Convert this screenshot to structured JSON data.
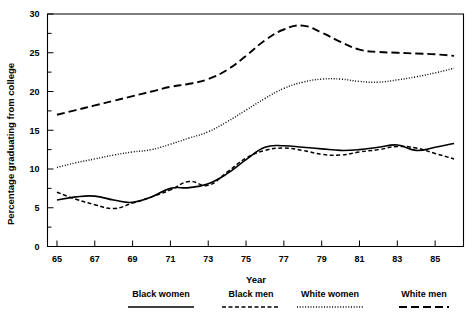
{
  "chart_data": {
    "type": "line",
    "title": "",
    "xlabel": "Year",
    "ylabel": "Percentage graduating from college",
    "xlim": [
      64.5,
      86.5
    ],
    "ylim": [
      0,
      30
    ],
    "xticks": [
      65,
      67,
      69,
      71,
      73,
      75,
      77,
      79,
      81,
      83,
      85
    ],
    "xtick_labels": [
      "65",
      "67",
      "69",
      "71",
      "73",
      "75",
      "77",
      "79",
      "81",
      "83",
      "85"
    ],
    "yticks": [
      0,
      5,
      10,
      15,
      20,
      25,
      30
    ],
    "ytick_labels": [
      "0",
      "5",
      "10",
      "15",
      "20",
      "25",
      "30"
    ],
    "y_minor_ticks": [
      2.5,
      7.5,
      12.5,
      17.5,
      22.5,
      27.5
    ],
    "grid": false,
    "legend_position": "below",
    "x": [
      65,
      66,
      67,
      68,
      69,
      70,
      71,
      72,
      73,
      74,
      75,
      76,
      77,
      78,
      79,
      80,
      81,
      82,
      83,
      84,
      85,
      86
    ],
    "series": [
      {
        "name": "Black women",
        "style": "solid",
        "values": [
          6.0,
          6.4,
          6.5,
          6.0,
          5.7,
          6.4,
          7.5,
          7.6,
          8.1,
          9.4,
          11.2,
          12.8,
          13.0,
          12.8,
          12.6,
          12.4,
          12.5,
          12.8,
          13.1,
          12.4,
          12.8,
          13.3
        ]
      },
      {
        "name": "Black men",
        "style": "dashed-short",
        "values": [
          7.0,
          6.1,
          5.4,
          4.9,
          5.6,
          6.4,
          7.3,
          8.4,
          7.9,
          9.6,
          11.4,
          12.4,
          12.7,
          12.4,
          11.9,
          11.8,
          12.2,
          12.5,
          12.9,
          12.7,
          12.0,
          11.3
        ]
      },
      {
        "name": "White women",
        "style": "dotted",
        "values": [
          10.2,
          10.8,
          11.3,
          11.8,
          12.2,
          12.5,
          13.2,
          14.0,
          14.8,
          16.1,
          17.6,
          19.1,
          20.4,
          21.2,
          21.6,
          21.6,
          21.3,
          21.2,
          21.5,
          21.9,
          22.4,
          23.0
        ]
      },
      {
        "name": "White men",
        "style": "dashed-long",
        "values": [
          17.0,
          17.6,
          18.2,
          18.8,
          19.4,
          20.0,
          20.6,
          21.0,
          21.6,
          22.8,
          24.6,
          26.6,
          28.0,
          28.5,
          27.6,
          26.4,
          25.4,
          25.1,
          25.0,
          24.9,
          24.8,
          24.6
        ]
      }
    ]
  },
  "axes": {
    "y_title": "Percentage graduating from college",
    "x_title": "Year"
  },
  "legend": {
    "items": [
      {
        "label": "Black women",
        "style": "solid"
      },
      {
        "label": "Black men",
        "style": "dashed-short"
      },
      {
        "label": "White women",
        "style": "dotted"
      },
      {
        "label": "White men",
        "style": "dashed-long"
      }
    ]
  }
}
